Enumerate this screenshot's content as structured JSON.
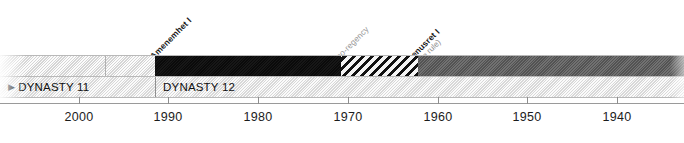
{
  "chart_data": {
    "type": "timeline",
    "title": "",
    "xlabel": "",
    "ylabel": "",
    "axis": {
      "direction": "reversed",
      "era": "BC",
      "tick_labels": [
        "2000",
        "1990",
        "1980",
        "1970",
        "1960",
        "1950",
        "1940"
      ],
      "tick_values": [
        2000,
        1990,
        1980,
        1970,
        1960,
        1950,
        1940
      ],
      "tick_x": [
        79,
        168,
        258,
        348,
        438,
        527,
        617
      ],
      "pixels_per_decade": 89.6,
      "domain_left_year": 2008.8,
      "domain_right_year": 1932.5,
      "grid": false
    },
    "reign_segments": [
      {
        "name": "pre-12th-dynasty",
        "fill": "light-hatch",
        "start_year": 2008.8,
        "end_year": 1991.5,
        "x": 0,
        "width": 155
      },
      {
        "name": "Amenemhet I sole reign",
        "fill": "solid-black",
        "start_year": 1991.5,
        "end_year": 1970.7,
        "x": 155,
        "width": 186
      },
      {
        "name": "co-regency",
        "fill": "diagonal-hatch",
        "start_year": 1970.7,
        "end_year": 1962.1,
        "x": 341,
        "width": 77
      },
      {
        "name": "Senusret I sole rule",
        "fill": "solid-grey",
        "start_year": 1962.1,
        "end_year": 1932.5,
        "x": 418,
        "width": 266
      }
    ],
    "dynasty_segments": [
      {
        "label": "DYNASTY 11",
        "marker": "▶",
        "x": 0,
        "width": 155,
        "start_year": 2008.8,
        "end_year": 1991.5
      },
      {
        "label": "DYNASTY 12",
        "marker": "",
        "x": 155,
        "width": 529,
        "start_year": 1991.5,
        "end_year": 1932.5
      }
    ],
    "annotations": [
      {
        "title": "Amenemhet I",
        "subtitle": "",
        "style": "bold-dark",
        "x": 155,
        "year": 1991.5
      },
      {
        "title": "co-regency",
        "subtitle": "",
        "style": "light-grey",
        "x": 341,
        "year": 1970.7
      },
      {
        "title": "Senusret I",
        "subtitle": "(sole rule)",
        "style": "bold-dark",
        "x": 418,
        "year": 1962.1
      }
    ],
    "internal_rule_x": [
      105
    ]
  },
  "colors": {
    "solid_black": "#0b0b0b",
    "solid_grey": "#5c5c5c",
    "band_light": "#e9e9e9",
    "hatch_dark": "#121212",
    "border": "#b9b9b9",
    "axis": "#9a9a9a",
    "text_dark": "#1c1c1c",
    "text_muted": "#9a9a9a",
    "background": "#ffffff"
  }
}
